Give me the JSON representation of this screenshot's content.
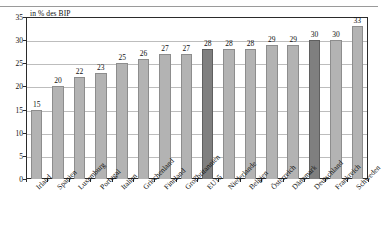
{
  "chart_data": {
    "type": "bar",
    "title": "in % des BIP",
    "xlabel": "",
    "ylabel": "",
    "ylim": [
      0,
      35
    ],
    "yticks": [
      0,
      5,
      10,
      15,
      20,
      25,
      30,
      35
    ],
    "grid": true,
    "legend": "none",
    "categories": [
      "Irland",
      "Spanien",
      "Luxemburg",
      "Portugal",
      "Italien",
      "Griechenland",
      "Finnland",
      "Großbritannien",
      "EU15",
      "Niederlande",
      "Belgien",
      "Österreich",
      "Dänemark",
      "Deutschland",
      "Frankreich",
      "Schweden"
    ],
    "values": [
      15,
      20,
      22,
      23,
      25,
      26,
      27,
      27,
      28,
      28,
      28,
      29,
      29,
      30,
      30,
      33
    ],
    "highlighted": [
      "EU15",
      "Deutschland"
    ],
    "colors": {
      "bar": "#b3b3b3",
      "bar_highlight": "#7f7f7f",
      "bar_edge": "#8d8d8d",
      "axis": "#2b2b2b",
      "grid": "#bdbdbd",
      "text": "#111111"
    }
  }
}
